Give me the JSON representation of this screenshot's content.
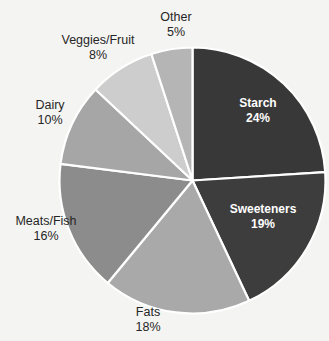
{
  "chart_data": {
    "type": "pie",
    "title": "",
    "xlabel": "",
    "ylabel": "",
    "legend_position": "none",
    "grid": false,
    "start_angle_deg": 0,
    "direction": "clockwise",
    "categories": [
      "Starch",
      "Sweeteners",
      "Fats",
      "Meats/Fish",
      "Dairy",
      "Veggies/Fruit",
      "Other"
    ],
    "values": [
      24,
      19,
      18,
      16,
      10,
      8,
      5
    ],
    "value_suffix": "%",
    "slices": [
      {
        "label": "Starch",
        "value": 24,
        "value_text": "24%",
        "color": "#383838",
        "label_color": "#ffffff",
        "label_placement": "inside"
      },
      {
        "label": "Sweeteners",
        "value": 19,
        "value_text": "19%",
        "color": "#3d3d3d",
        "label_color": "#ffffff",
        "label_placement": "inside"
      },
      {
        "label": "Fats",
        "value": 18,
        "value_text": "18%",
        "color": "#a9a9a9",
        "label_color": "#262626",
        "label_placement": "outside"
      },
      {
        "label": "Meats/Fish",
        "value": 16,
        "value_text": "16%",
        "color": "#8c8c8c",
        "label_color": "#262626",
        "label_placement": "outside"
      },
      {
        "label": "Dairy",
        "value": 10,
        "value_text": "10%",
        "color": "#a6a6a6",
        "label_color": "#262626",
        "label_placement": "outside"
      },
      {
        "label": "Veggies/Fruit",
        "value": 8,
        "value_text": "8%",
        "color": "#cdcdcd",
        "label_color": "#262626",
        "label_placement": "outside"
      },
      {
        "label": "Other",
        "value": 5,
        "value_text": "5%",
        "color": "#b5b5b5",
        "label_color": "#262626",
        "label_placement": "outside"
      }
    ],
    "separator_color": "#ffffff",
    "background_color": "#f4f4f2"
  }
}
